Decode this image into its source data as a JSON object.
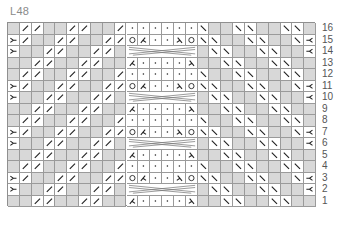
{
  "chart_label": "L48",
  "colors": {
    "empty_cell": "#d8d8d8",
    "symbol_cell": "#ffffff",
    "grid_line": "#9a9a9a",
    "symbol_stroke": "#222222",
    "label_text": "#8a8a8a",
    "row_number_text": "#555555"
  },
  "grid": {
    "columns": 26,
    "rows": 16,
    "legend_codes": {
      "g": "empty (gray) cell",
      "/": "right-slanting stitch",
      "\\": "left-slanting stitch",
      ".": "dot (purl)",
      "O": "yarn over",
      "kl": "left decrease (lambda)",
      "kr": "right decrease (lambda)",
      "Y": "Y symbol (left edge)",
      "Yr": "mirrored Y symbol (right edge)",
      "C": "cable crossing over 6 stitches"
    },
    "row_numbers": [
      "16",
      "15",
      "14",
      "13",
      "12",
      "11",
      "10",
      "9",
      "8",
      "7",
      "6",
      "5",
      "4",
      "3",
      "2",
      "1"
    ],
    "rows_top_to_bottom": [
      [
        "g",
        "/",
        "/",
        "g",
        "g",
        "/",
        "/",
        "g",
        "g",
        "/",
        ".",
        ".",
        ".",
        ".",
        ".",
        ".",
        "\\",
        "g",
        "g",
        "\\",
        "\\",
        "g",
        "g",
        "\\",
        "\\",
        "g"
      ],
      [
        "Y",
        "/",
        "g",
        "g",
        "/",
        "/",
        "g",
        "g",
        "/",
        "/",
        "O",
        "kl",
        ".",
        ".",
        "kr",
        "O",
        "\\",
        "\\",
        "g",
        "g",
        "\\",
        "\\",
        "g",
        "g",
        "\\",
        "Yr"
      ],
      [
        "Y",
        "g",
        "g",
        "/",
        "/",
        "g",
        "g",
        "/",
        "/",
        "g",
        "C",
        "C",
        "C",
        "C",
        "C",
        "C",
        "g",
        "\\",
        "\\",
        "g",
        "g",
        "\\",
        "\\",
        "g",
        "g",
        "Yr"
      ],
      [
        "g",
        "g",
        "/",
        "/",
        "g",
        "g",
        "/",
        "/",
        "g",
        "g",
        "kl",
        ".",
        ".",
        ".",
        ".",
        "kr",
        "g",
        "g",
        "\\",
        "\\",
        "g",
        "g",
        "\\",
        "\\",
        "g",
        "g"
      ],
      [
        "g",
        "/",
        "/",
        "g",
        "g",
        "/",
        "/",
        "g",
        "g",
        "/",
        ".",
        ".",
        ".",
        ".",
        ".",
        ".",
        "\\",
        "g",
        "g",
        "\\",
        "\\",
        "g",
        "g",
        "\\",
        "\\",
        "g"
      ],
      [
        "Y",
        "/",
        "g",
        "g",
        "/",
        "/",
        "g",
        "g",
        "/",
        "/",
        "O",
        "kl",
        ".",
        ".",
        "kr",
        "O",
        "\\",
        "\\",
        "g",
        "g",
        "\\",
        "\\",
        "g",
        "g",
        "\\",
        "Yr"
      ],
      [
        "Y",
        "g",
        "g",
        "/",
        "/",
        "g",
        "g",
        "/",
        "/",
        "g",
        "C",
        "C",
        "C",
        "C",
        "C",
        "C",
        "g",
        "\\",
        "\\",
        "g",
        "g",
        "\\",
        "\\",
        "g",
        "g",
        "Yr"
      ],
      [
        "g",
        "g",
        "/",
        "/",
        "g",
        "g",
        "/",
        "/",
        "g",
        "g",
        "kl",
        ".",
        ".",
        ".",
        ".",
        "kr",
        "g",
        "g",
        "\\",
        "\\",
        "g",
        "g",
        "\\",
        "\\",
        "g",
        "g"
      ],
      [
        "g",
        "/",
        "/",
        "g",
        "g",
        "/",
        "/",
        "g",
        "g",
        "/",
        ".",
        ".",
        ".",
        ".",
        ".",
        ".",
        "\\",
        "g",
        "g",
        "\\",
        "\\",
        "g",
        "g",
        "\\",
        "\\",
        "g"
      ],
      [
        "Y",
        "/",
        "g",
        "g",
        "/",
        "/",
        "g",
        "g",
        "/",
        "/",
        "O",
        "kl",
        ".",
        ".",
        "kr",
        "O",
        "\\",
        "\\",
        "g",
        "g",
        "\\",
        "\\",
        "g",
        "g",
        "\\",
        "Yr"
      ],
      [
        "Y",
        "g",
        "g",
        "/",
        "/",
        "g",
        "g",
        "/",
        "/",
        "g",
        "C",
        "C",
        "C",
        "C",
        "C",
        "C",
        "g",
        "\\",
        "\\",
        "g",
        "g",
        "\\",
        "\\",
        "g",
        "g",
        "Yr"
      ],
      [
        "g",
        "g",
        "/",
        "/",
        "g",
        "g",
        "/",
        "/",
        "g",
        "g",
        "kl",
        ".",
        ".",
        ".",
        ".",
        "kr",
        "g",
        "g",
        "\\",
        "\\",
        "g",
        "g",
        "\\",
        "\\",
        "g",
        "g"
      ],
      [
        "g",
        "/",
        "/",
        "g",
        "g",
        "/",
        "/",
        "g",
        "g",
        "/",
        ".",
        ".",
        ".",
        ".",
        ".",
        ".",
        "\\",
        "g",
        "g",
        "\\",
        "\\",
        "g",
        "g",
        "\\",
        "\\",
        "g"
      ],
      [
        "Y",
        "/",
        "g",
        "g",
        "/",
        "/",
        "g",
        "g",
        "/",
        "/",
        "O",
        "kl",
        ".",
        ".",
        "kr",
        "O",
        "\\",
        "\\",
        "g",
        "g",
        "\\",
        "\\",
        "g",
        "g",
        "\\",
        "Yr"
      ],
      [
        "Y",
        "g",
        "g",
        "/",
        "/",
        "g",
        "g",
        "/",
        "/",
        "g",
        "C",
        "C",
        "C",
        "C",
        "C",
        "C",
        "g",
        "\\",
        "\\",
        "g",
        "g",
        "\\",
        "\\",
        "g",
        "g",
        "Yr"
      ],
      [
        "g",
        "g",
        "/",
        "/",
        "g",
        "g",
        "/",
        "/",
        "g",
        "g",
        "kl",
        ".",
        ".",
        ".",
        ".",
        "kr",
        "g",
        "g",
        "\\",
        "\\",
        "g",
        "g",
        "\\",
        "\\",
        "g",
        "g"
      ]
    ]
  }
}
